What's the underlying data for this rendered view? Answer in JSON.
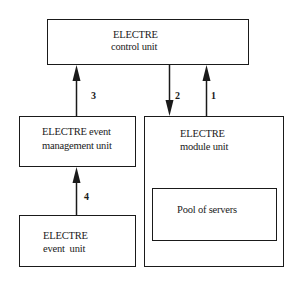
{
  "diagram": {
    "nodes": {
      "control_unit": {
        "line1": "ELECTRE",
        "line2": "control unit"
      },
      "event_management_unit": {
        "line1": "ELECTRE event",
        "line2": "management unit"
      },
      "module_unit": {
        "line1": "ELECTRE",
        "line2": "module unit"
      },
      "pool_of_servers": {
        "label": "Pool of servers"
      },
      "event_unit": {
        "line1": "ELECTRE",
        "line2": "event  unit"
      }
    },
    "edges": [
      {
        "id": "1",
        "label": "1",
        "from": "module_unit",
        "to": "control_unit"
      },
      {
        "id": "2",
        "label": "2",
        "from": "control_unit",
        "to": "module_unit"
      },
      {
        "id": "3",
        "label": "3",
        "from": "event_management_unit",
        "to": "control_unit"
      },
      {
        "id": "4",
        "label": "4",
        "from": "event_unit",
        "to": "event_management_unit"
      }
    ]
  }
}
